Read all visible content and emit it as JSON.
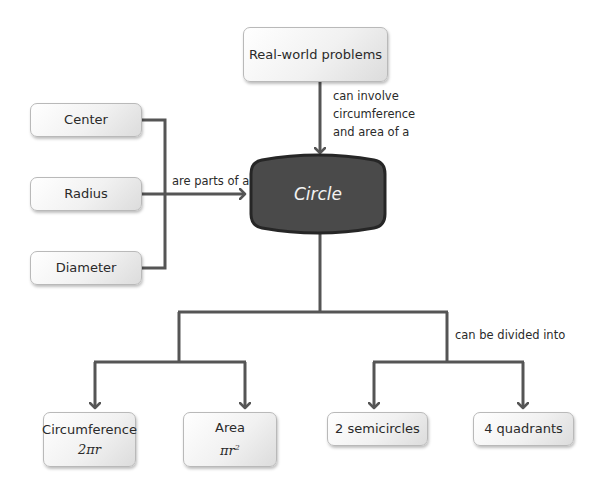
{
  "central": {
    "label": "Circle"
  },
  "top_node": {
    "label": "Real-world problems",
    "relation": [
      "can involve",
      "circumference",
      "and area of a"
    ]
  },
  "left_nodes": [
    {
      "label": "Center"
    },
    {
      "label": "Radius"
    },
    {
      "label": "Diameter"
    }
  ],
  "left_relation": "are parts of a",
  "bottom_left": [
    {
      "label": "Circumference",
      "formula": "2πr"
    },
    {
      "label": "Area",
      "formula": "πr",
      "formula_sup": "2"
    }
  ],
  "bottom_right_relation": "can be divided into",
  "bottom_right": [
    {
      "label": "2 semicircles"
    },
    {
      "label": "4 quadrants"
    }
  ],
  "colors": {
    "line": "#555555",
    "central_fill": "#4a4a4a",
    "central_border": "#262626",
    "central_text": "#f2f2f2"
  }
}
